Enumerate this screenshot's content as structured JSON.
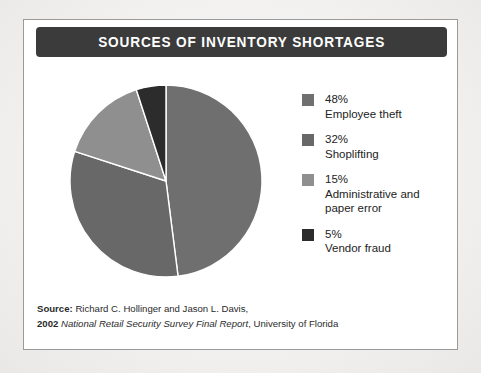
{
  "figure": {
    "title": "SOURCES OF INVENTORY SHORTAGES"
  },
  "legend": {
    "items": [
      {
        "pct": "48%",
        "label": "Employee theft",
        "color": "#6f6f6f"
      },
      {
        "pct": "32%",
        "label": "Shoplifting",
        "color": "#686868"
      },
      {
        "pct": "15%",
        "label": "Administrative and\npaper error",
        "label_line1": "Administrative and",
        "label_line2": "paper error",
        "color": "#8f8f8f"
      },
      {
        "pct": "5%",
        "label": "Vendor fraud",
        "color": "#2c2c2c"
      }
    ]
  },
  "source": {
    "line1_bold": "Source:",
    "line1_rest": " Richard C. Hollinger and Jason L. Davis,",
    "line2_bold": "2002",
    "line2_italic": "National Retail Security Survey Final Report",
    "line2_rest": ", University of Florida"
  },
  "chart_data": {
    "type": "pie",
    "title": "SOURCES OF INVENTORY SHORTAGES",
    "categories": [
      "Employee theft",
      "Shoplifting",
      "Administrative and paper error",
      "Vendor fraud"
    ],
    "values": [
      48,
      32,
      15,
      5
    ],
    "units": "percent",
    "colors": [
      "#6f6f6f",
      "#686868",
      "#8f8f8f",
      "#2c2c2c"
    ],
    "start_angle_deg": 0,
    "direction": "clockwise",
    "slice_separator_color": "#ffffff",
    "legend_position": "right",
    "grid": false,
    "center": {
      "x": 98,
      "y": 98
    },
    "radius": 96
  }
}
